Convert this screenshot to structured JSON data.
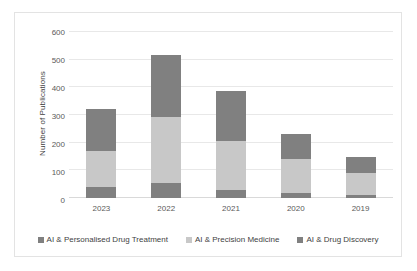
{
  "chart_data": {
    "type": "bar",
    "subtype": "stacked-bar-vertical",
    "title": "",
    "xlabel": "",
    "ylabel": "Number of Publications",
    "categories": [
      "2023",
      "2022",
      "2021",
      "2020",
      "2019"
    ],
    "ylim": [
      0,
      600
    ],
    "yticks": [
      0,
      100,
      200,
      300,
      400,
      500,
      600
    ],
    "ytick_labels": [
      "0",
      "100",
      "200",
      "300",
      "400",
      "500",
      "600"
    ],
    "grid": true,
    "legend_position": "bottom",
    "series": [
      {
        "name": "AI & Personalised Drug Treatment",
        "color": "#808080",
        "values": [
          40,
          53,
          28,
          18,
          10
        ]
      },
      {
        "name": "AI & Precision Medicine",
        "color": "#c8c8c8",
        "values": [
          130,
          240,
          179,
          124,
          80
        ]
      },
      {
        "name": "AI & Drug Discovery",
        "color": "#808080",
        "values": [
          152,
          224,
          181,
          89,
          59
        ]
      }
    ],
    "totals": [
      322,
      517,
      388,
      231,
      149
    ]
  },
  "legend": {
    "items": [
      {
        "label": "AI & Personalised Drug Treatment",
        "color": "#808080"
      },
      {
        "label": "AI & Precision Medicine",
        "color": "#c8c8c8"
      },
      {
        "label": "AI & Drug Discovery",
        "color": "#808080"
      }
    ]
  },
  "colors": {
    "series_dark": "#808080",
    "series_light": "#c8c8c8",
    "gridline": "#e8e8e8",
    "baseline": "#d9d9d9",
    "border": "#e3e3e3",
    "text": "#3f3f3f",
    "tick_text": "#5a5a5a",
    "background": "#ffffff"
  }
}
